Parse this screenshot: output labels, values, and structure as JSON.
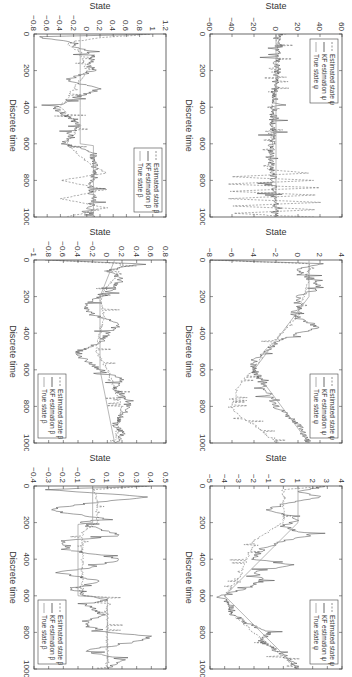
{
  "figure": {
    "layout": "2 rows x 3 columns, rotated 90 degrees clockwise",
    "background": "#ffffff",
    "line_color": "#555555"
  },
  "chart_data": [
    {
      "id": "psi-1",
      "type": "line",
      "xlabel": "Discrete time",
      "ylabel": "State",
      "xlim": [
        0,
        1000
      ],
      "ylim": [
        -60,
        60
      ],
      "xticks": [
        0,
        200,
        400,
        600,
        800,
        1000
      ],
      "yticks": [
        -60,
        -40,
        -20,
        0,
        20,
        40,
        60
      ],
      "legend_position": "upper-left",
      "legend": [
        "Estimated state ψ",
        "KF estimation ψ",
        "True state ψ"
      ],
      "series": [
        {
          "name": "Estimated state ψ",
          "style": "dashed",
          "x": [
            0,
            20,
            50,
            100,
            200,
            300,
            400,
            500,
            600,
            700,
            740,
            760,
            780,
            800,
            820,
            840,
            860,
            880,
            900,
            920,
            940,
            960,
            980,
            1000
          ],
          "y": [
            8,
            2,
            1,
            1,
            2,
            -1,
            -3,
            -3,
            -4,
            -5,
            -8,
            30,
            -40,
            35,
            -45,
            38,
            -42,
            36,
            -44,
            40,
            -40,
            38,
            -38,
            35
          ]
        },
        {
          "name": "KF estimation ψ",
          "style": "solid-dark",
          "x": [
            0,
            20,
            50,
            100,
            200,
            300,
            400,
            500,
            600,
            700,
            750,
            800,
            900,
            1000
          ],
          "y": [
            5,
            1,
            1,
            1,
            1,
            -1,
            -2,
            -3,
            -4,
            -4,
            -3,
            -2,
            -1,
            -1
          ]
        },
        {
          "name": "True state ψ",
          "style": "solid-light",
          "x": [
            0,
            1000
          ],
          "y": [
            0,
            0
          ]
        }
      ]
    },
    {
      "id": "psi-2",
      "type": "line",
      "xlabel": "Discrete time",
      "ylabel": "State",
      "xlim": [
        0,
        1000
      ],
      "ylim": [
        -8,
        4
      ],
      "xticks": [
        0,
        200,
        400,
        600,
        800,
        1000
      ],
      "yticks": [
        -8,
        -6,
        -4,
        -2,
        0,
        2,
        4
      ],
      "legend_position": "upper-right",
      "legend": [
        "Estimated state ψ",
        "KF estimation ψ",
        "True state ψ"
      ],
      "series": [
        {
          "name": "Estimated state ψ",
          "style": "dashed",
          "x": [
            0,
            20,
            40,
            100,
            200,
            300,
            400,
            500,
            600,
            650,
            700,
            800,
            850,
            900,
            950,
            1000
          ],
          "y": [
            -8,
            1,
            1,
            1,
            0.5,
            0,
            -1.5,
            -3,
            -4,
            -5,
            -5.5,
            -6,
            -5.5,
            -4,
            -3,
            -2
          ]
        },
        {
          "name": "KF estimation ψ",
          "style": "solid-dark",
          "x": [
            0,
            20,
            50,
            100,
            150,
            200,
            250,
            300,
            370,
            400,
            450,
            500,
            550,
            600,
            650,
            700,
            750,
            800,
            850,
            900,
            950,
            1000
          ],
          "y": [
            -8,
            2,
            0,
            1,
            2,
            0,
            0,
            -0.5,
            2,
            0,
            -2,
            -3,
            -4,
            -4,
            -3.5,
            -3,
            -2.5,
            -2,
            -1,
            0,
            0.5,
            1
          ]
        },
        {
          "name": "True state ψ",
          "style": "solid-light",
          "x": [
            0,
            200,
            600,
            1000
          ],
          "y": [
            1,
            1,
            -4,
            1
          ]
        }
      ]
    },
    {
      "id": "psi-3",
      "type": "line",
      "xlabel": "Discrete time",
      "ylabel": "State",
      "xlim": [
        0,
        1000
      ],
      "ylim": [
        -5,
        4
      ],
      "xticks": [
        0,
        200,
        400,
        600,
        800,
        1000
      ],
      "yticks": [
        -5,
        -4,
        -3,
        -2,
        -1,
        0,
        1,
        2,
        3,
        4
      ],
      "legend_position": "upper-right",
      "legend": [
        "Estimated state ψ",
        "KF estimation ψ",
        "True state ψ"
      ],
      "series": [
        {
          "name": "Estimated state ψ",
          "style": "dashed",
          "x": [
            0,
            20,
            50,
            100,
            200,
            250,
            300,
            400,
            500,
            600,
            700,
            800,
            900,
            1000
          ],
          "y": [
            3,
            0,
            0,
            0,
            0,
            -1,
            -2,
            -2.5,
            -3,
            -4,
            -3.5,
            -2,
            -0.5,
            1
          ]
        },
        {
          "name": "KF estimation ψ",
          "style": "solid-dark",
          "x": [
            0,
            30,
            60,
            100,
            130,
            180,
            220,
            270,
            300,
            350,
            400,
            430,
            470,
            520,
            560,
            600,
            650,
            700,
            750,
            800,
            850,
            900,
            950,
            1000
          ],
          "y": [
            3,
            1,
            2.5,
            0,
            -1,
            1,
            0,
            2,
            0,
            -1.5,
            -2,
            0.5,
            -2,
            -1.5,
            -2.5,
            -4.5,
            -3.5,
            -3.5,
            -2.5,
            -1,
            -1.5,
            -0.5,
            0.5,
            1
          ]
        },
        {
          "name": "True state ψ",
          "style": "solid-light",
          "x": [
            0,
            200,
            600,
            1000
          ],
          "y": [
            1,
            1,
            -4,
            1
          ]
        }
      ]
    },
    {
      "id": "beta-1",
      "type": "line",
      "xlabel": "Discrete time",
      "ylabel": "State",
      "xlim": [
        0,
        1000
      ],
      "ylim": [
        -0.8,
        1.2
      ],
      "xticks": [
        0,
        200,
        400,
        600,
        800,
        1000
      ],
      "yticks": [
        -0.8,
        -0.6,
        -0.4,
        -0.2,
        0,
        0.2,
        0.4,
        0.6,
        0.8,
        1,
        1.2
      ],
      "legend_position": "upper-right",
      "legend": [
        "Estimated state β",
        "KF estimation β",
        "True state β"
      ],
      "series": [
        {
          "name": "Estimated state β",
          "style": "dashed",
          "x": [
            0,
            20,
            50,
            100,
            200,
            300,
            400,
            500,
            600,
            700,
            760,
            800,
            850,
            900,
            950,
            1000
          ],
          "y": [
            1,
            0.2,
            -0.3,
            -0.1,
            0,
            -0.2,
            -0.4,
            -0.1,
            -0.3,
            0,
            0.3,
            -0.4,
            0.3,
            -0.4,
            0.3,
            -0.3
          ]
        },
        {
          "name": "KF estimation β",
          "style": "solid-dark",
          "x": [
            0,
            15,
            40,
            80,
            120,
            160,
            200,
            250,
            300,
            350,
            400,
            450,
            500,
            550,
            600,
            650,
            700,
            750,
            800,
            850,
            900,
            950,
            1000
          ],
          "y": [
            1.1,
            -0.7,
            -0.3,
            -0.1,
            0.1,
            0.05,
            0.1,
            -0.3,
            0.2,
            -0.2,
            -0.5,
            -0.3,
            -0.1,
            -0.3,
            -0.35,
            0.1,
            0.1,
            0.15,
            0.1,
            0.05,
            0.1,
            0.05,
            0.1
          ]
        },
        {
          "name": "True state β",
          "style": "solid-light",
          "x": [
            0,
            200,
            210,
            400,
            410,
            600,
            610,
            1000
          ],
          "y": [
            -0.1,
            -0.1,
            -0.1,
            -0.1,
            -0.1,
            -0.1,
            0.1,
            0.1
          ]
        }
      ]
    },
    {
      "id": "beta-2",
      "type": "line",
      "xlabel": "Discrete time",
      "ylabel": "State",
      "xlim": [
        0,
        1000
      ],
      "ylim": [
        -1,
        0.8
      ],
      "xticks": [
        0,
        200,
        400,
        600,
        800,
        1000
      ],
      "yticks": [
        -1,
        -0.8,
        -0.6,
        -0.4,
        -0.2,
        0,
        0.2,
        0.4,
        0.6,
        0.8
      ],
      "legend_position": "lower-right",
      "legend": [
        "Estimated state β",
        "KF estimation β",
        "True state β"
      ],
      "series": [
        {
          "name": "Estimated state β",
          "style": "dashed",
          "x": [
            0,
            20,
            100,
            200,
            300,
            400,
            500,
            600,
            700,
            800,
            900,
            1000
          ],
          "y": [
            -0.8,
            0.2,
            0.1,
            -0.1,
            -0.05,
            -0.1,
            -0.15,
            0,
            0.1,
            0.2,
            0.15,
            0.1
          ]
        },
        {
          "name": "KF estimation β",
          "style": "solid-dark",
          "x": [
            0,
            20,
            60,
            100,
            150,
            200,
            250,
            300,
            350,
            400,
            450,
            500,
            550,
            600,
            650,
            700,
            750,
            800,
            850,
            900,
            950,
            1000
          ],
          "y": [
            -0.8,
            0.4,
            0,
            0.2,
            0.1,
            -0.1,
            -0.3,
            -0.2,
            0.2,
            0,
            -0.1,
            -0.4,
            -0.3,
            -0.1,
            0.2,
            0.1,
            0.2,
            0.3,
            0.2,
            0.1,
            0.2,
            0.1
          ]
        },
        {
          "name": "True state β",
          "style": "solid-light",
          "x": [
            0,
            200,
            600,
            1000
          ],
          "y": [
            0.1,
            -0.1,
            -0.1,
            0.1
          ]
        }
      ]
    },
    {
      "id": "beta-3",
      "type": "line",
      "xlabel": "Discrete time",
      "ylabel": "State",
      "xlim": [
        0,
        1000
      ],
      "ylim": [
        -0.4,
        0.5
      ],
      "xticks": [
        0,
        200,
        400,
        600,
        800,
        1000
      ],
      "yticks": [
        -0.4,
        -0.3,
        -0.2,
        -0.1,
        0,
        0.1,
        0.2,
        0.3,
        0.4,
        0.5
      ],
      "legend_position": "lower-right",
      "legend": [
        "Estimated state β",
        "KF estimation β",
        "True state β"
      ],
      "series": [
        {
          "name": "Estimated state β",
          "style": "dashed",
          "x": [
            0,
            20,
            50,
            100,
            200,
            250,
            300,
            400,
            500,
            600,
            610,
            700,
            800,
            1000
          ],
          "y": [
            0.4,
            0,
            0.03,
            0.03,
            0.03,
            -0.07,
            -0.07,
            -0.07,
            -0.07,
            -0.07,
            0.1,
            0.1,
            0.1,
            0.1
          ]
        },
        {
          "name": "KF estimation β",
          "style": "solid-dark",
          "x": [
            0,
            20,
            60,
            100,
            130,
            180,
            200,
            270,
            300,
            350,
            400,
            450,
            470,
            520,
            560,
            600,
            620,
            650,
            700,
            750,
            800,
            820,
            850,
            900,
            950,
            1000
          ],
          "y": [
            0.4,
            -0.3,
            0.4,
            -0.1,
            -0.3,
            0.08,
            -0.1,
            0.2,
            -0.2,
            -0.15,
            0.2,
            -0.05,
            -0.25,
            0.05,
            -0.15,
            -0.05,
            0.1,
            -0.05,
            0.08,
            -0.05,
            0.1,
            0.4,
            0.3,
            -0.05,
            0.2,
            0.1
          ]
        },
        {
          "name": "True state β",
          "style": "solid-light",
          "x": [
            0,
            200,
            210,
            600,
            610,
            1000
          ],
          "y": [
            0,
            0,
            -0.1,
            -0.1,
            0.1,
            0.1
          ]
        }
      ]
    }
  ]
}
